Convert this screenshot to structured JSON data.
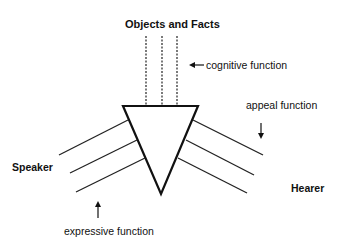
{
  "diagram": {
    "type": "organon-model",
    "labels": {
      "top": "Objects and Facts",
      "cognitive": "cognitive function",
      "appeal": "appeal function",
      "speaker": "Speaker",
      "hearer": "Hearer",
      "expressive": "expressive function"
    },
    "colors": {
      "stroke": "#111111",
      "background": "#ffffff"
    }
  }
}
